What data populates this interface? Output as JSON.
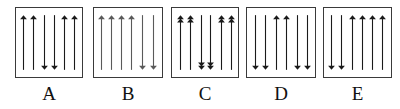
{
  "figure": {
    "type": "spin-configuration-diagram",
    "background_color": "#ffffff",
    "stroke_color": "#3a3a3a",
    "arrow_color_dark": "#1a1a1a",
    "arrow_color_light": "#5a5a5a",
    "panel_count": 5,
    "panels": [
      {
        "label": "A",
        "left": 15,
        "width": 68,
        "arrow_count": 6,
        "head_style": "single",
        "ink": "dark",
        "arrows": [
          {
            "x_pct": 12,
            "dir": "up"
          },
          {
            "x_pct": 27,
            "dir": "up"
          },
          {
            "x_pct": 43,
            "dir": "down"
          },
          {
            "x_pct": 58,
            "dir": "down"
          },
          {
            "x_pct": 74,
            "dir": "up"
          },
          {
            "x_pct": 89,
            "dir": "up"
          }
        ]
      },
      {
        "label": "B",
        "left": 93,
        "width": 70,
        "arrow_count": 6,
        "head_style": "single",
        "ink": "light",
        "arrows": [
          {
            "x_pct": 11,
            "dir": "up"
          },
          {
            "x_pct": 26,
            "dir": "up"
          },
          {
            "x_pct": 40,
            "dir": "up"
          },
          {
            "x_pct": 55,
            "dir": "up"
          },
          {
            "x_pct": 72,
            "dir": "down"
          },
          {
            "x_pct": 88,
            "dir": "down"
          }
        ]
      },
      {
        "label": "C",
        "left": 171,
        "width": 68,
        "arrow_count": 6,
        "head_style": "double",
        "ink": "dark",
        "arrows": [
          {
            "x_pct": 13,
            "dir": "up"
          },
          {
            "x_pct": 28,
            "dir": "up"
          },
          {
            "x_pct": 44,
            "dir": "down"
          },
          {
            "x_pct": 59,
            "dir": "down"
          },
          {
            "x_pct": 75,
            "dir": "up"
          },
          {
            "x_pct": 90,
            "dir": "up"
          }
        ]
      },
      {
        "label": "D",
        "left": 246,
        "width": 70,
        "arrow_count": 6,
        "head_style": "single",
        "ink": "dark",
        "arrows": [
          {
            "x_pct": 12,
            "dir": "down"
          },
          {
            "x_pct": 27,
            "dir": "down"
          },
          {
            "x_pct": 43,
            "dir": "up"
          },
          {
            "x_pct": 58,
            "dir": "up"
          },
          {
            "x_pct": 74,
            "dir": "down"
          },
          {
            "x_pct": 89,
            "dir": "down"
          }
        ]
      },
      {
        "label": "E",
        "left": 323,
        "width": 69,
        "arrow_count": 6,
        "head_style": "single",
        "ink": "dark",
        "arrows": [
          {
            "x_pct": 11,
            "dir": "down"
          },
          {
            "x_pct": 26,
            "dir": "down"
          },
          {
            "x_pct": 42,
            "dir": "up"
          },
          {
            "x_pct": 57,
            "dir": "up"
          },
          {
            "x_pct": 73,
            "dir": "up"
          },
          {
            "x_pct": 88,
            "dir": "up"
          }
        ]
      }
    ]
  }
}
